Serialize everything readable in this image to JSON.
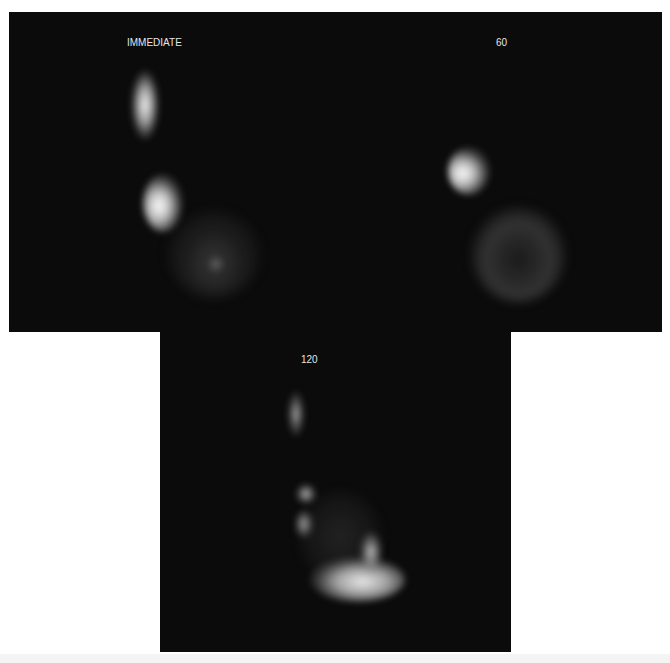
{
  "figure": {
    "panels": [
      {
        "id": "immediate",
        "label": "IMMEDIATE"
      },
      {
        "id": "60min",
        "label": "60"
      },
      {
        "id": "120min",
        "label": "120"
      }
    ],
    "colors": {
      "background": "#0b0b0b",
      "uptake_bright": "#ffffff",
      "label_text": "#e6e6e6",
      "page_background": "#ffffff"
    }
  }
}
